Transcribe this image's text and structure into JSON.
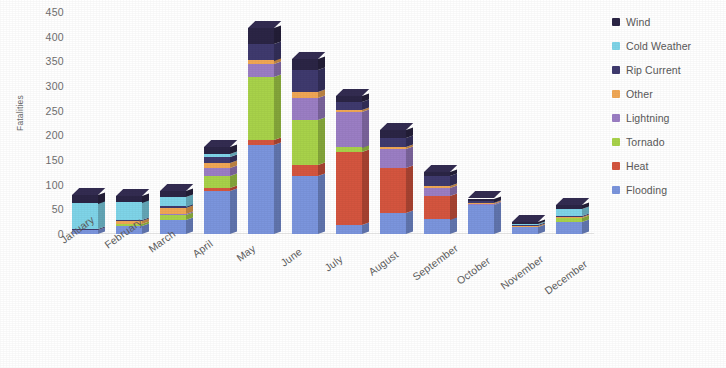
{
  "chart_data": {
    "type": "bar",
    "stacked": true,
    "title": "",
    "xlabel": "",
    "ylabel": "Fatalities",
    "ylim": [
      0,
      450
    ],
    "ytick_step": 50,
    "yticks": [
      "450",
      "400",
      "350",
      "300",
      "250",
      "200",
      "150",
      "100",
      "50",
      "0"
    ],
    "grid": false,
    "legend_position": "right",
    "categories": [
      "January",
      "February",
      "March",
      "April",
      "May",
      "June",
      "July",
      "August",
      "September",
      "October",
      "November",
      "December"
    ],
    "series": [
      {
        "name": "Flooding",
        "color": "#7b95dd",
        "values": [
          8,
          16,
          28,
          88,
          180,
          118,
          18,
          42,
          30,
          58,
          14,
          24
        ]
      },
      {
        "name": "Heat",
        "color": "#d4553f",
        "values": [
          0,
          0,
          0,
          6,
          10,
          22,
          148,
          92,
          48,
          0,
          0,
          0
        ]
      },
      {
        "name": "Tornado",
        "color": "#a8d24a",
        "values": [
          0,
          4,
          10,
          24,
          128,
          92,
          10,
          0,
          0,
          0,
          0,
          8
        ]
      },
      {
        "name": "Lightning",
        "color": "#9b7ec4",
        "values": [
          0,
          0,
          2,
          16,
          26,
          44,
          72,
          38,
          16,
          2,
          0,
          0
        ]
      },
      {
        "name": "Other",
        "color": "#f0a755",
        "values": [
          0,
          6,
          12,
          10,
          8,
          12,
          4,
          4,
          4,
          2,
          2,
          2
        ]
      },
      {
        "name": "Rip Current",
        "color": "#3f3a6e",
        "values": [
          2,
          2,
          4,
          12,
          34,
          44,
          16,
          18,
          20,
          4,
          2,
          2
        ]
      },
      {
        "name": "Cold Weather",
        "color": "#7fd4e8",
        "values": [
          52,
          36,
          20,
          6,
          0,
          0,
          0,
          0,
          0,
          0,
          2,
          14
        ]
      },
      {
        "name": "Wind",
        "color": "#2b2545",
        "values": [
          18,
          14,
          12,
          14,
          32,
          22,
          12,
          16,
          8,
          6,
          4,
          8
        ]
      }
    ],
    "totals": [
      80,
      78,
      88,
      176,
      418,
      354,
      280,
      210,
      126,
      72,
      24,
      58
    ]
  },
  "legend": {
    "items": [
      {
        "label": "Wind",
        "color": "#2b2545"
      },
      {
        "label": "Cold Weather",
        "color": "#7fd4e8"
      },
      {
        "label": "Rip Current",
        "color": "#3f3a6e"
      },
      {
        "label": "Other",
        "color": "#f0a755"
      },
      {
        "label": "Lightning",
        "color": "#9b7ec4"
      },
      {
        "label": "Tornado",
        "color": "#a8d24a"
      },
      {
        "label": "Heat",
        "color": "#d4553f"
      },
      {
        "label": "Flooding",
        "color": "#7b95dd"
      }
    ]
  }
}
